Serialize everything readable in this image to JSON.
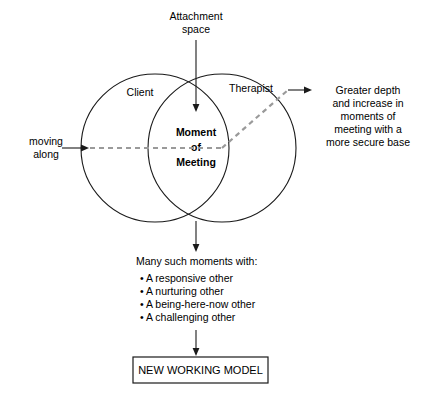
{
  "diagram": {
    "top_label": {
      "line1": "Attachment",
      "line2": "space"
    },
    "left_label": {
      "line1": "moving",
      "line2": "along"
    },
    "circles": {
      "left_label": "Client",
      "right_label": "Therapist"
    },
    "center_label": {
      "line1": "Moment",
      "line2": "of",
      "line3": "Meeting"
    },
    "right_label": {
      "line1": "Greater depth",
      "line2": "and increase in",
      "line3": "moments of",
      "line4": "meeting with a",
      "line5": "more secure base"
    },
    "moments": {
      "heading": "Many such moments with:",
      "items": [
        "• A responsive other",
        "• A nurturing other",
        "• A being-here-now other",
        "• A challenging other"
      ]
    },
    "outcome_box": {
      "label": "NEW WORKING MODEL"
    },
    "colors": {
      "stroke": "#1a1a1a",
      "dashed": "#9a9a9a",
      "background": "#ffffff"
    }
  }
}
